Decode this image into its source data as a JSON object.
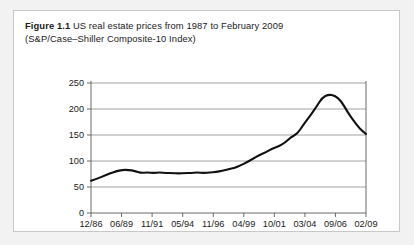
{
  "figure": {
    "label": "Figure 1.1",
    "caption_line1": "US real estate prices from 1987 to February 2009",
    "caption_line2": "(S&P/Case–Shiller Composite-10 Index)"
  },
  "chart_data": {
    "type": "line",
    "title": "US real estate prices from 1987 to February 2009 (S&P/Case–Shiller Composite-10 Index)",
    "xlabel": "",
    "ylabel": "",
    "ylim": [
      0,
      250
    ],
    "yticks": [
      0,
      50,
      100,
      150,
      200,
      250
    ],
    "grid": true,
    "legend": "none",
    "line_color": "#111111",
    "xticklabels": [
      "12/86",
      "06/89",
      "11/91",
      "05/94",
      "11/96",
      "04/99",
      "10/01",
      "03/04",
      "09/06",
      "02/09"
    ],
    "x": [
      "12/86",
      "06/87",
      "12/87",
      "06/88",
      "12/88",
      "06/89",
      "12/89",
      "06/90",
      "11/91",
      "06/92",
      "12/92",
      "06/93",
      "12/93",
      "05/94",
      "12/94",
      "06/95",
      "12/95",
      "06/96",
      "11/96",
      "06/97",
      "12/97",
      "06/98",
      "12/98",
      "04/99",
      "12/99",
      "06/00",
      "12/00",
      "06/01",
      "10/01",
      "06/02",
      "12/02",
      "06/03",
      "12/03",
      "03/04",
      "12/04",
      "06/05",
      "12/05",
      "06/06",
      "09/06",
      "12/06",
      "06/07",
      "12/07",
      "06/08",
      "12/08",
      "02/09"
    ],
    "values": [
      62,
      66,
      71,
      76,
      80,
      83,
      83,
      81,
      77,
      78,
      77,
      78,
      77,
      77,
      76,
      77,
      77,
      78,
      77,
      78,
      79,
      81,
      84,
      87,
      92,
      98,
      105,
      112,
      117,
      124,
      128,
      135,
      146,
      152,
      170,
      186,
      203,
      222,
      228,
      226,
      216,
      195,
      178,
      162,
      152
    ],
    "annotations": {
      "start_value": 62,
      "early_peak_value": 83,
      "plateau_value": 77,
      "peak_value": 228,
      "peak_label": "09/06",
      "end_value": 152,
      "end_label": "02/09"
    }
  }
}
